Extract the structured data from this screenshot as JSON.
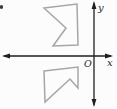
{
  "figure": {
    "background_color": "#fcfcfc",
    "axis_color": "#1f1f1f",
    "shape_stroke_color": "#a6a6a6",
    "speck_color": "#3a3a3a",
    "labels": {
      "x_axis": "x",
      "y_axis": "y",
      "origin": "O"
    },
    "axes": {
      "x_axis_y": "56",
      "y_axis_x": "94"
    },
    "upper_polygon": {
      "points": "44,8 77,4 78,45 53,46 66,28",
      "vertices": [
        [
          44,
          8
        ],
        [
          77,
          4
        ],
        [
          78,
          45
        ],
        [
          53,
          46
        ],
        [
          66,
          28
        ]
      ]
    },
    "lower_polygon": {
      "points": "44,71 78,67 78,88 70,79 45,102",
      "vertices": [
        [
          44,
          71
        ],
        [
          78,
          67
        ],
        [
          78,
          88
        ],
        [
          70,
          79
        ],
        [
          45,
          102
        ]
      ]
    },
    "arrowheads": {
      "left": "2,56 10,53.6 10,58.4",
      "right": "113,56 105,53.6 105,58.4",
      "top": "94,1 91.6,9 96.4,9",
      "bottom": "94,107 91.6,99 96.4,99"
    }
  }
}
